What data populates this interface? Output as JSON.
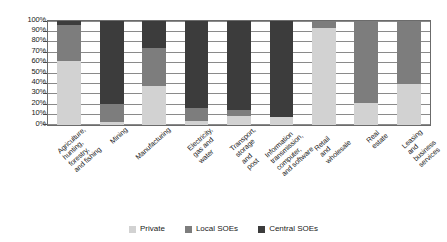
{
  "chart_data": {
    "type": "bar",
    "subtype": "stacked-100-percent",
    "title": "",
    "xlabel": "",
    "ylabel": "",
    "ylim": [
      0,
      100
    ],
    "ytick_labels": [
      "100%",
      "90%",
      "80%",
      "70%",
      "60%",
      "50%",
      "40%",
      "30%",
      "20%",
      "10%",
      "0%"
    ],
    "ytick_values": [
      100,
      90,
      80,
      70,
      60,
      50,
      40,
      30,
      20,
      10,
      0
    ],
    "grid": true,
    "legend_position": "bottom-center",
    "categories": [
      "Agriculture, hunting,\nforestry, and fishing",
      "Mining",
      "Manufacturing",
      "Electricity, gas and\nwater",
      "Transport, storage and\npost",
      "Information transmission,\ncomputer, and software",
      "Retail and wholesale",
      "Real estate",
      "Leasing and business\nservices"
    ],
    "series": [
      {
        "name": "Private",
        "color": "#d2d2d2",
        "values": [
          61,
          2,
          37,
          3,
          8,
          7,
          93,
          21,
          39
        ]
      },
      {
        "name": "Local SOEs",
        "color": "#7d7d7d",
        "values": [
          35,
          18,
          37,
          13,
          6,
          0,
          7,
          79,
          61
        ]
      },
      {
        "name": "Central SOEs",
        "color": "#3c3c3c",
        "values": [
          4,
          80,
          26,
          84,
          86,
          93,
          0,
          0,
          0
        ]
      }
    ]
  },
  "legend": {
    "items": [
      {
        "label": "Private",
        "color": "#d2d2d2"
      },
      {
        "label": "Local SOEs",
        "color": "#7d7d7d"
      },
      {
        "label": "Central SOEs",
        "color": "#3c3c3c"
      }
    ]
  }
}
